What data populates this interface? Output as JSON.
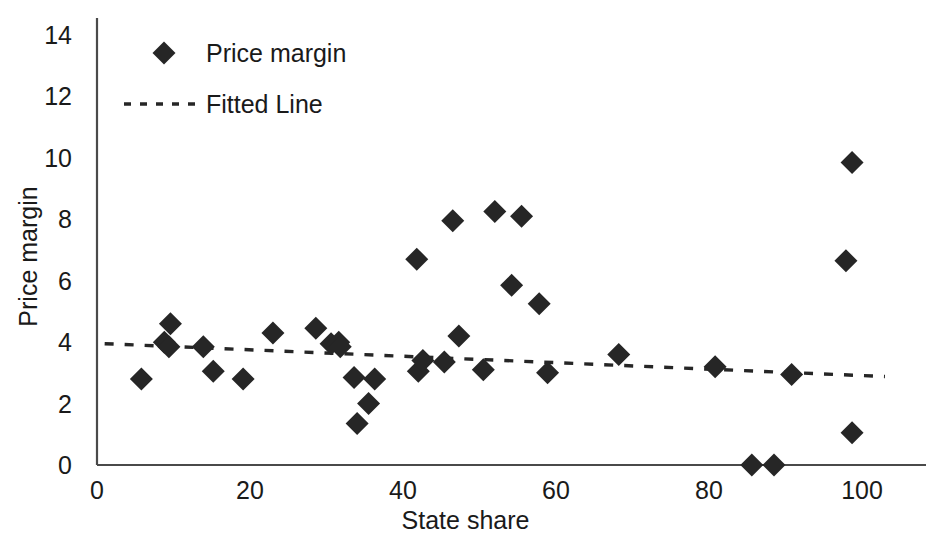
{
  "chart_data": {
    "type": "scatter",
    "title": "",
    "xlabel": "State share",
    "ylabel": "Price margin",
    "xlim": [
      0,
      105
    ],
    "ylim": [
      0,
      14.6
    ],
    "xticks": [
      "0",
      "20",
      "40",
      "60",
      "80",
      "100"
    ],
    "xtick_values": [
      0,
      20,
      40,
      60,
      80,
      100
    ],
    "yticks": [
      "0",
      "2",
      "4",
      "6",
      "8",
      "10",
      "12",
      "14"
    ],
    "ytick_values": [
      0,
      2,
      4,
      6,
      8,
      10,
      12,
      14
    ],
    "grid": false,
    "legend_position": "top-left",
    "series": [
      {
        "name": "Price margin",
        "type": "scatter",
        "marker": "diamond",
        "color": "#262626",
        "points": [
          {
            "x": 5.8,
            "y": 2.8
          },
          {
            "x": 8.8,
            "y": 4.0
          },
          {
            "x": 9.6,
            "y": 4.6
          },
          {
            "x": 9.4,
            "y": 3.85
          },
          {
            "x": 13.9,
            "y": 3.85
          },
          {
            "x": 15.2,
            "y": 3.05
          },
          {
            "x": 19.1,
            "y": 2.8
          },
          {
            "x": 23.0,
            "y": 4.3
          },
          {
            "x": 28.6,
            "y": 4.45
          },
          {
            "x": 30.6,
            "y": 3.95
          },
          {
            "x": 31.6,
            "y": 4.0
          },
          {
            "x": 31.8,
            "y": 3.85
          },
          {
            "x": 33.6,
            "y": 2.85
          },
          {
            "x": 34.0,
            "y": 1.35
          },
          {
            "x": 35.5,
            "y": 2.0
          },
          {
            "x": 36.3,
            "y": 2.8
          },
          {
            "x": 41.8,
            "y": 6.7
          },
          {
            "x": 42.0,
            "y": 3.05
          },
          {
            "x": 42.6,
            "y": 3.4
          },
          {
            "x": 45.4,
            "y": 3.35
          },
          {
            "x": 46.5,
            "y": 7.95
          },
          {
            "x": 47.3,
            "y": 4.2
          },
          {
            "x": 50.5,
            "y": 3.1
          },
          {
            "x": 52.0,
            "y": 8.25
          },
          {
            "x": 54.2,
            "y": 5.85
          },
          {
            "x": 55.5,
            "y": 8.1
          },
          {
            "x": 57.8,
            "y": 5.25
          },
          {
            "x": 58.9,
            "y": 3.0
          },
          {
            "x": 68.2,
            "y": 3.6
          },
          {
            "x": 80.8,
            "y": 3.2
          },
          {
            "x": 85.6,
            "y": 0.0
          },
          {
            "x": 88.5,
            "y": 0.0
          },
          {
            "x": 90.8,
            "y": 2.95
          },
          {
            "x": 97.9,
            "y": 6.65
          },
          {
            "x": 98.7,
            "y": 9.85
          },
          {
            "x": 98.7,
            "y": 1.05
          }
        ]
      },
      {
        "name": "Fitted Line",
        "type": "line",
        "style": "dotted",
        "color": "#262626",
        "endpoints": [
          {
            "x": 1.0,
            "y": 3.95
          },
          {
            "x": 103.0,
            "y": 2.88
          }
        ]
      }
    ]
  },
  "legend": {
    "items": [
      {
        "label": "Price margin",
        "marker": "diamond"
      },
      {
        "label": "Fitted Line",
        "marker": "dotted-line"
      }
    ]
  },
  "axes": {
    "x_title": "State share",
    "y_title": "Price margin"
  }
}
